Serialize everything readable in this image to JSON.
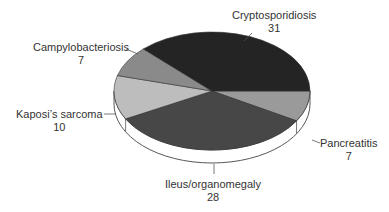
{
  "chart_data": {
    "type": "pie",
    "style": "3d-tilted",
    "title": "",
    "total": 83,
    "slices": [
      {
        "label": "Cryptosporidiosis",
        "value": 31,
        "color": "#242424"
      },
      {
        "label": "Pancreatitis",
        "value": 7,
        "color": "#9a9a9a"
      },
      {
        "label": "Ileus/organomegaly",
        "value": 28,
        "color": "#474747"
      },
      {
        "label": "Kaposi's sarcoma",
        "value": 10,
        "color": "#bdbdbd"
      },
      {
        "label": "Campylobacteriosis",
        "value": 7,
        "color": "#8a8a8a"
      }
    ],
    "legend": "none (leader-line labels)"
  },
  "labels": {
    "crypto": {
      "name": "Cryptosporidiosis",
      "value": "31"
    },
    "pancreatitis": {
      "name": "Pancreatitis",
      "value": "7"
    },
    "ileus": {
      "name": "Ileus/organomegaly",
      "value": "28"
    },
    "kaposi": {
      "name": "Kaposi’s sarcoma",
      "value": "10"
    },
    "campy": {
      "name": "Campylobacteriosis",
      "value": "7"
    }
  }
}
